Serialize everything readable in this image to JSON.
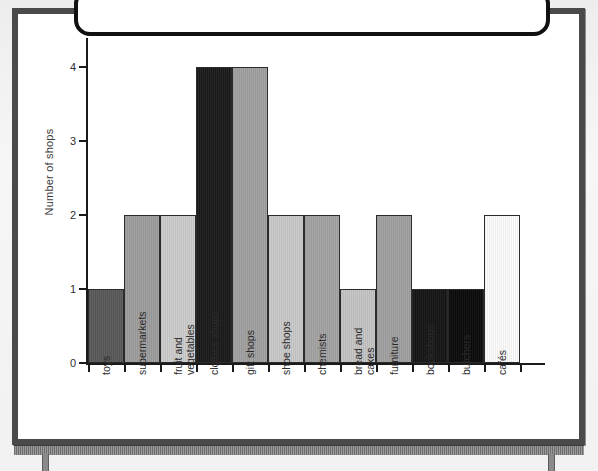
{
  "figure": {
    "type": "bar-chart-on-whiteboard",
    "frame_color": "#4a4a4a",
    "card_border_color": "#111111",
    "board_background": "#ffffff"
  },
  "chart_data": {
    "type": "bar",
    "title": "",
    "xlabel": "",
    "ylabel": "Number of shops",
    "ylim": [
      0,
      4
    ],
    "yticks": [
      "0",
      "1",
      "2",
      "3",
      "4"
    ],
    "grid": false,
    "legend": null,
    "categories": [
      "toys",
      "supermarkets",
      "fruit and vegetables",
      "clothes shops",
      "gift shops",
      "shoe shops",
      "chemists",
      "bread and cakes",
      "furniture",
      "bookshops",
      "butchers",
      "cafés"
    ],
    "category_lines": [
      [
        "toys"
      ],
      [
        "supermarkets"
      ],
      [
        "fruit and",
        "vegetables"
      ],
      [
        "clothes shops"
      ],
      [
        "gift shops"
      ],
      [
        "shoe shops"
      ],
      [
        "chemists"
      ],
      [
        "bread and",
        "cakes"
      ],
      [
        "furniture"
      ],
      [
        "bookshops"
      ],
      [
        "butchers"
      ],
      [
        "cafés"
      ]
    ],
    "values": [
      1,
      2,
      2,
      4,
      4,
      2,
      2,
      1,
      2,
      1,
      1,
      2
    ],
    "bar_colors": [
      "#595959",
      "#9d9d9d",
      "#cccccc",
      "#1a1a1a",
      "#a0a0a0",
      "#c9c9c9",
      "#a3a3a3",
      "#c4c4c4",
      "#a0a0a0",
      "#151515",
      "#0b0b0b",
      "#fbfbfb"
    ]
  }
}
